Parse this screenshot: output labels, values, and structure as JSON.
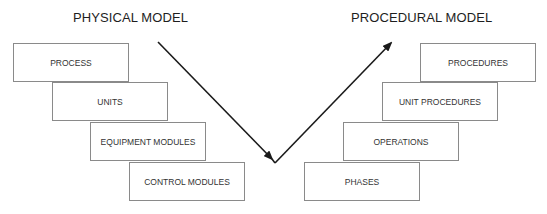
{
  "physical_model": {
    "title": "PHYSICAL MODEL",
    "levels": [
      "PROCESS",
      "UNITS",
      "EQUIPMENT MODULES",
      "CONTROL MODULES"
    ]
  },
  "procedural_model": {
    "title": "PROCEDURAL MODEL",
    "levels": [
      "PROCEDURES",
      "UNIT PROCEDURES",
      "OPERATIONS",
      "PHASES"
    ]
  },
  "colors": {
    "line": "#1a1a1a",
    "box_border": "#8a8a8a"
  }
}
